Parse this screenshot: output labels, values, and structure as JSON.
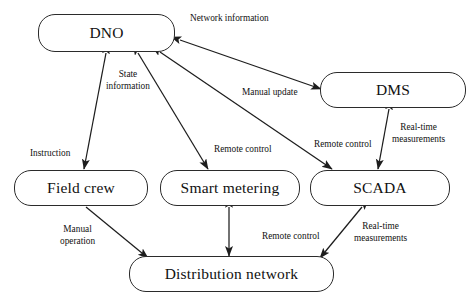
{
  "diagram": {
    "type": "block-flow-diagram",
    "width": 475,
    "height": 307,
    "stroke_color": "#2b2b2b",
    "background_color": "#ffffff",
    "text_color": "#111111",
    "nodes": [
      {
        "id": "dno",
        "label": "DNO",
        "x": 38,
        "y": 14,
        "w": 137,
        "h": 38
      },
      {
        "id": "dms",
        "label": "DMS",
        "x": 320,
        "y": 72,
        "w": 146,
        "h": 36
      },
      {
        "id": "field",
        "label": "Field crew",
        "x": 14,
        "y": 170,
        "w": 134,
        "h": 36
      },
      {
        "id": "smart",
        "label": "Smart metering",
        "x": 160,
        "y": 170,
        "w": 140,
        "h": 36
      },
      {
        "id": "scada",
        "label": "SCADA",
        "x": 310,
        "y": 170,
        "w": 140,
        "h": 36
      },
      {
        "id": "dist",
        "label": "Distribution network",
        "x": 129,
        "y": 256,
        "w": 205,
        "h": 36
      }
    ],
    "edges": [
      {
        "id": "dno-dms",
        "from": "dno",
        "to": "dms",
        "arrows": "both",
        "labels": [
          "Network information",
          "Manual update"
        ]
      },
      {
        "id": "dno-field",
        "from": "dno",
        "to": "field",
        "arrows": "both",
        "labels": [
          "Instruction"
        ]
      },
      {
        "id": "dno-smart",
        "from": "dno",
        "to": "smart",
        "arrows": "both",
        "labels": [
          "State information",
          "Remote control"
        ]
      },
      {
        "id": "dno-scada",
        "from": "dno",
        "to": "scada",
        "arrows": "both",
        "labels": [
          "Remote control"
        ]
      },
      {
        "id": "dms-scada",
        "from": "dms",
        "to": "scada",
        "arrows": "both",
        "labels": [
          "Remote control",
          "Real-time measurements"
        ]
      },
      {
        "id": "field-dist",
        "from": "field",
        "to": "dist",
        "arrows": "end",
        "labels": [
          "Manual operation"
        ]
      },
      {
        "id": "smart-dist",
        "from": "smart",
        "to": "dist",
        "arrows": "both",
        "labels": []
      },
      {
        "id": "scada-dist",
        "from": "scada",
        "to": "dist",
        "arrows": "both",
        "labels": [
          "Remote control",
          "Real-time measurements"
        ]
      }
    ],
    "edge_labels": [
      {
        "id": "network-information",
        "text": "Network information",
        "x": 190,
        "y": 13,
        "align": "left"
      },
      {
        "id": "state-information",
        "text": "State\ninformation",
        "x": 106,
        "y": 69,
        "align": "center"
      },
      {
        "id": "manual-update",
        "text": "Manual update",
        "x": 242,
        "y": 87,
        "align": "left"
      },
      {
        "id": "instruction",
        "text": "Instruction",
        "x": 30,
        "y": 148,
        "align": "left"
      },
      {
        "id": "remote-control-smart",
        "text": "Remote control",
        "x": 214,
        "y": 144,
        "align": "left"
      },
      {
        "id": "remote-control-scada",
        "text": "Remote control",
        "x": 314,
        "y": 139,
        "align": "left"
      },
      {
        "id": "real-time-dms",
        "text": "Real-time\nmeasurements",
        "x": 392,
        "y": 122,
        "align": "center"
      },
      {
        "id": "manual-operation",
        "text": "Manual\noperation",
        "x": 60,
        "y": 224,
        "align": "center"
      },
      {
        "id": "remote-control-dist",
        "text": "Remote control",
        "x": 262,
        "y": 231,
        "align": "left"
      },
      {
        "id": "real-time-dist",
        "text": "Real-time\nmeasurements",
        "x": 354,
        "y": 221,
        "align": "center"
      }
    ]
  }
}
